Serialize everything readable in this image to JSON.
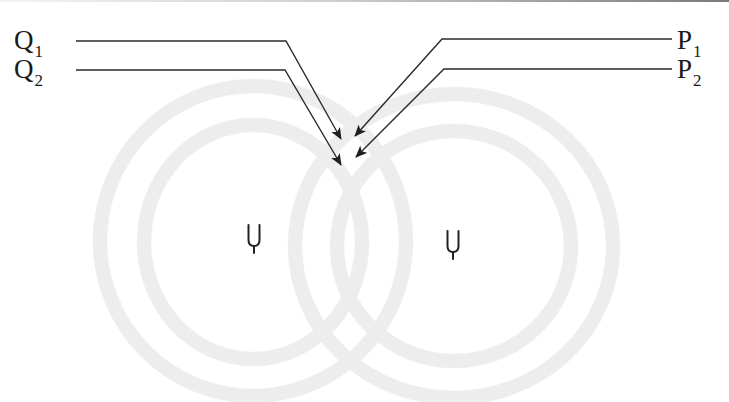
{
  "diagram": {
    "labels": {
      "q1": {
        "base": "Q",
        "sub": "1"
      },
      "q2": {
        "base": "Q",
        "sub": "2"
      },
      "p1": {
        "base": "P",
        "sub": "1"
      },
      "p2": {
        "base": "P",
        "sub": "2"
      }
    },
    "sources": [
      {
        "name": "left-tuning-fork",
        "icon": "tuning-fork-icon"
      },
      {
        "name": "right-tuning-fork",
        "icon": "tuning-fork-icon"
      }
    ],
    "wavefronts_per_source": 2,
    "colors": {
      "line": "#2a2a2a",
      "wavefront": "#e9e9e9",
      "text": "#1a1a1a",
      "background": "#ffffff"
    }
  }
}
